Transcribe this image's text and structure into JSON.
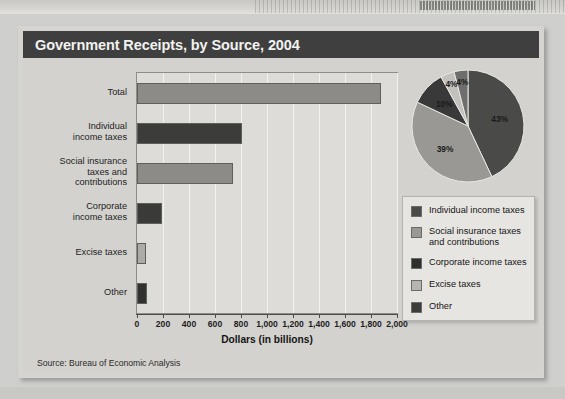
{
  "figure": {
    "title": "Government Receipts, by Source, 2004",
    "source": "Source:  Bureau of Economic Analysis"
  },
  "chart_data": [
    {
      "type": "bar",
      "orientation": "horizontal",
      "title": "Government Receipts, by Source, 2004",
      "xlabel": "Dollars (in billions)",
      "ylabel": "",
      "xlim": [
        0,
        2000
      ],
      "xticks": [
        0,
        200,
        400,
        600,
        800,
        1000,
        1200,
        1400,
        1600,
        1800,
        2000
      ],
      "xtick_labels": [
        "0",
        "200",
        "400",
        "600",
        "800",
        "1,000",
        "1,200",
        "1,400",
        "1,600",
        "1,800",
        "2,000"
      ],
      "grid": true,
      "legend_position": "right",
      "categories": [
        "Total",
        "Individual\nincome taxes",
        "Social insurance\ntaxes and\ncontributions",
        "Corporate\nincome taxes",
        "Excise taxes",
        "Other"
      ],
      "values": [
        1880,
        810,
        740,
        190,
        70,
        78
      ],
      "colors": [
        "#8c8b87",
        "#3c3c3a",
        "#8c8b87",
        "#3a3a38",
        "#acaba7",
        "#313130"
      ]
    },
    {
      "type": "pie",
      "labels": [
        "Individual income taxes",
        "Social insurance taxes and contributions",
        "Corporate income taxes",
        "Excise taxes",
        "Other"
      ],
      "values": [
        43,
        39,
        10,
        4,
        4
      ],
      "value_labels": [
        "43%",
        "39%",
        "10%",
        "4%",
        "4%"
      ],
      "colors": [
        "#4a4a48",
        "#999894",
        "#39393a",
        "#c2c1bd",
        "#6e6e6c"
      ],
      "start_angle_deg": 0
    }
  ],
  "legend": {
    "items": [
      {
        "label": "Individual income taxes",
        "color": "#4a4a48"
      },
      {
        "label": "Social insurance taxes\nand contributions",
        "color": "#999894"
      },
      {
        "label": "Corporate income taxes",
        "color": "#2f2f2e"
      },
      {
        "label": "Excise taxes",
        "color": "#b6b5b1"
      },
      {
        "label": "Other",
        "color": "#3c3c3b"
      }
    ]
  }
}
